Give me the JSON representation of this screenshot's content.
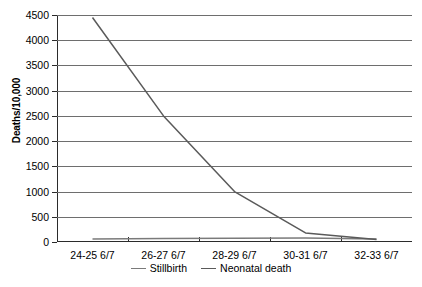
{
  "chart_data": {
    "type": "line",
    "title": "",
    "xlabel": "",
    "ylabel": "Deaths/10,000",
    "categories": [
      "24-25 6/7",
      "26-27 6/7",
      "28-29 6/7",
      "30-31 6/7",
      "32-33 6/7"
    ],
    "ylim": [
      0,
      4500
    ],
    "yticks": [
      0,
      500,
      1000,
      1500,
      2000,
      2500,
      3000,
      3500,
      4000,
      4500
    ],
    "ytick_labels": [
      "0",
      "500",
      "1000",
      "1500",
      "2000",
      "2500",
      "3000",
      "3500",
      "4000",
      "4500"
    ],
    "grid": "horizontal",
    "legend_position": "bottom-center",
    "series": [
      {
        "name": "Stillbirth",
        "color": "#7a7a7a",
        "values": [
          60,
          70,
          75,
          80,
          60
        ]
      },
      {
        "name": "Neonatal death",
        "color": "#5a5a5a",
        "values": [
          4450,
          2500,
          1000,
          180,
          50
        ]
      }
    ]
  },
  "legend": {
    "items": [
      {
        "label": "Stillbirth"
      },
      {
        "label": "Neonatal death"
      }
    ]
  },
  "colors": {
    "axis": "#2b2b2b",
    "gridline": "#6e6e6e",
    "stillbirth": "#7a7a7a",
    "neonatal": "#5a5a5a",
    "background": "#ffffff"
  }
}
